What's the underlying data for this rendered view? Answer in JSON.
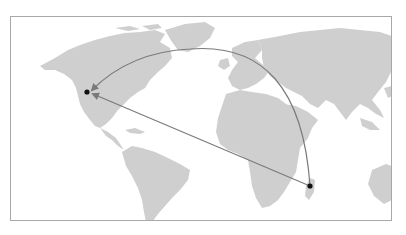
{
  "map": {
    "projection": "world-equirectangular-cropped",
    "land_color": "#cfcfcf",
    "ocean_color": "#ffffff",
    "frame_color": "#a8a8a8",
    "line_color": "#7a7a7a",
    "point_color": "#111111"
  },
  "points": [
    {
      "id": "origin",
      "label": "Madagascar",
      "x": 310,
      "y": 186
    },
    {
      "id": "destination",
      "label": "Western United States",
      "x": 87,
      "y": 92
    }
  ],
  "routes": [
    {
      "id": "great-arc",
      "type": "curved",
      "from": "origin",
      "to": "destination"
    },
    {
      "id": "direct",
      "type": "straight",
      "from": "origin",
      "to": "destination"
    }
  ]
}
